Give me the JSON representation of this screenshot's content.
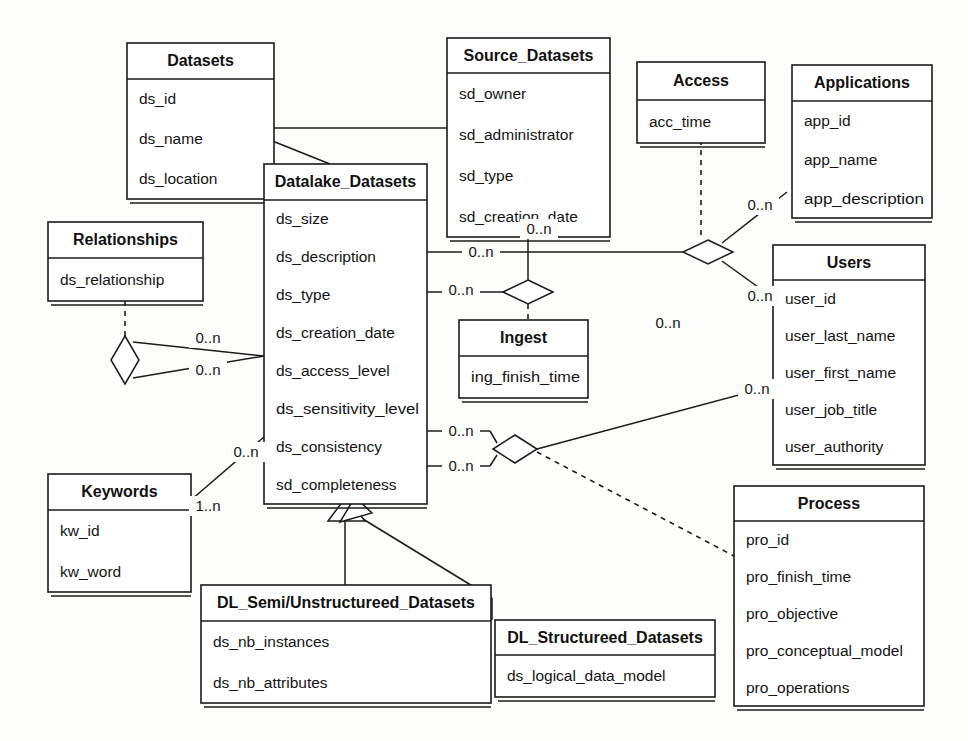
{
  "diagram": {
    "kind": "uml-class-diagram",
    "background_color": "#fdfdfc",
    "line_color": "#1b1b1b",
    "box_fill": "#ffffff"
  },
  "classes": [
    {
      "id": "datasets",
      "name": "Datasets",
      "attributes": [
        "ds_id",
        "ds_name",
        "ds_location"
      ],
      "x": 127,
      "y": 43,
      "w": 147,
      "title_h": 36,
      "row_h": 40
    },
    {
      "id": "source_datasets",
      "name": "Source_Datasets",
      "attributes": [
        "sd_owner",
        "sd_administrator",
        "sd_type",
        "sd_creation_date"
      ],
      "x": 447,
      "y": 38,
      "w": 163,
      "title_h": 35,
      "row_h": 41
    },
    {
      "id": "access",
      "name": "Access",
      "attributes": [
        "acc_time"
      ],
      "x": 637,
      "y": 62,
      "w": 128,
      "title_h": 38,
      "row_h": 43
    },
    {
      "id": "applications",
      "name": "Applications",
      "attributes": [
        "app_id",
        "app_name",
        "app_description"
      ],
      "x": 792,
      "y": 65,
      "w": 140,
      "title_h": 36,
      "row_h": 39
    },
    {
      "id": "relationships",
      "name": "Relationships",
      "attributes": [
        "ds_relationship"
      ],
      "x": 48,
      "y": 222,
      "w": 155,
      "title_h": 36,
      "row_h": 43
    },
    {
      "id": "datalake_datasets",
      "name": "Datalake_Datasets",
      "attributes": [
        "ds_size",
        "ds_description",
        "ds_type",
        "ds_creation_date",
        "ds_access_level",
        "ds_sensitivity_level",
        "ds_consistency",
        "sd_completeness"
      ],
      "x": 264,
      "y": 164,
      "w": 163,
      "title_h": 36,
      "row_h": 38
    },
    {
      "id": "ingest",
      "name": "Ingest",
      "attributes": [
        "ing_finish_time"
      ],
      "x": 459,
      "y": 320,
      "w": 129,
      "title_h": 36,
      "row_h": 42
    },
    {
      "id": "users",
      "name": "Users",
      "attributes": [
        "user_id",
        "user_last_name",
        "user_first_name",
        "user_job_title",
        "user_authority"
      ],
      "x": 773,
      "y": 245,
      "w": 152,
      "title_h": 35,
      "row_h": 37
    },
    {
      "id": "keywords",
      "name": "Keywords",
      "attributes": [
        "kw_id",
        "kw_word"
      ],
      "x": 48,
      "y": 474,
      "w": 143,
      "title_h": 36,
      "row_h": 41
    },
    {
      "id": "process",
      "name": "Process",
      "attributes": [
        "pro_id",
        "pro_finish_time",
        "pro_objective",
        "pro_conceptual_model",
        "pro_operations"
      ],
      "x": 734,
      "y": 486,
      "w": 190,
      "title_h": 35,
      "row_h": 37
    },
    {
      "id": "dl_semi_unstructureed_datasets",
      "name": "DL_Semi/Unstructureed_Datasets",
      "attributes": [
        "ds_nb_instances",
        "ds_nb_attributes"
      ],
      "x": 201,
      "y": 585,
      "w": 290,
      "title_h": 36,
      "row_h": 41
    },
    {
      "id": "dl_structureed_datasets",
      "name": "DL_Structureed_Datasets",
      "attributes": [
        "ds_logical_data_model"
      ],
      "x": 495,
      "y": 620,
      "w": 220,
      "title_h": 35,
      "row_h": 42
    }
  ],
  "multiplicity_labels": [
    {
      "id": "m-apps",
      "text": "0..n",
      "x": 760,
      "y": 205
    },
    {
      "id": "m-users-top",
      "text": "0..n",
      "x": 760,
      "y": 296
    },
    {
      "id": "m-sd-ingest",
      "text": "0..n",
      "x": 539,
      "y": 229
    },
    {
      "id": "m-dld-access",
      "text": "0..n",
      "x": 481,
      "y": 252
    },
    {
      "id": "m-dld-ingest",
      "text": "0..n",
      "x": 461,
      "y": 290
    },
    {
      "id": "m-users-mid",
      "text": "0..n",
      "x": 668,
      "y": 323
    },
    {
      "id": "m-users-low",
      "text": "0..n",
      "x": 757,
      "y": 389
    },
    {
      "id": "m-dld-proc-a",
      "text": "0..n",
      "x": 461,
      "y": 431
    },
    {
      "id": "m-dld-proc-b",
      "text": "0..n",
      "x": 461,
      "y": 466
    },
    {
      "id": "m-rel-a",
      "text": "0..n",
      "x": 208,
      "y": 338
    },
    {
      "id": "m-rel-b",
      "text": "0..n",
      "x": 208,
      "y": 370
    },
    {
      "id": "m-kw-dld",
      "text": "0..n",
      "x": 246,
      "y": 452
    },
    {
      "id": "m-kw",
      "text": "1..n",
      "x": 208,
      "y": 506
    }
  ],
  "relationship_notes": {
    "generalizations": [
      "Source_Datasets -> Datasets",
      "Datalake_Datasets -> Datasets",
      "DL_Semi/Unstructureed_Datasets -> Datalake_Datasets",
      "DL_Structureed_Datasets -> Datalake_Datasets"
    ],
    "association_classes": [
      "Access (on Applications-Users-Datalake_Datasets association)",
      "Ingest (on Source_Datasets-Datalake_Datasets association)",
      "Relationships (on Datalake_Datasets self-association)",
      "Process (on Datalake_Datasets-Users association)"
    ]
  }
}
